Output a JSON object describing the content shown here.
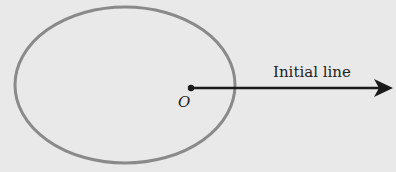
{
  "diagram": {
    "labels": {
      "origin": "O",
      "initial_line": "Initial line"
    },
    "elements": {
      "ellipse": {
        "cx": 125,
        "cy": 85,
        "rx": 110,
        "ry": 78,
        "stroke": "#8a8a8a",
        "stroke_width": 3
      },
      "pole": {
        "x": 191,
        "y": 88,
        "r": 3.2,
        "fill": "#1a1a1a"
      },
      "initial_line_arrow": {
        "x1": 191,
        "y1": 88,
        "x2": 393,
        "y2": 88,
        "stroke": "#1a1a1a"
      }
    },
    "colors": {
      "background": "#e9e9e9",
      "ellipse_stroke": "#8a8a8a",
      "line": "#1a1a1a",
      "text": "#222222"
    }
  }
}
